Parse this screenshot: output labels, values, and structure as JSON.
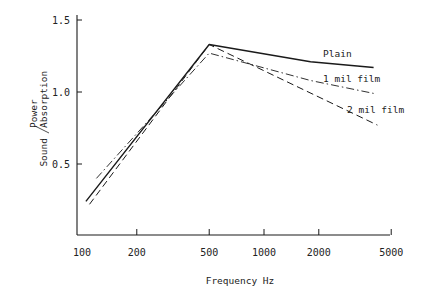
{
  "chart_data": {
    "type": "line",
    "title": "",
    "xlabel": "Frequency Hz",
    "ylabel_main": "Sound",
    "ylabel_sup": "Power",
    "ylabel_sub": "Absorption",
    "ylabel": "Sound Power / Absorption",
    "x_scale": "log",
    "x_ticks": [
      100,
      200,
      500,
      1000,
      2000,
      5000
    ],
    "x_tick_labels": [
      "100",
      "200",
      "500",
      "1000",
      "2000",
      "5000"
    ],
    "y_ticks": [
      0.5,
      1.0,
      1.5
    ],
    "y_tick_labels": [
      "0.5",
      "1.0",
      "1.5"
    ],
    "ylim": [
      0,
      1.55
    ],
    "grid": false,
    "legend_position": "inline labels at right end of lines",
    "series": [
      {
        "name": "Plain",
        "style": "solid",
        "x": [
          105,
          500,
          1800,
          4000
        ],
        "values": [
          0.24,
          1.33,
          1.21,
          1.17
        ]
      },
      {
        "name": "1 mil film",
        "style": "dash-dot",
        "x": [
          120,
          500,
          1800,
          4000
        ],
        "values": [
          0.4,
          1.27,
          1.08,
          0.99
        ]
      },
      {
        "name": "2 mil film",
        "style": "dashed",
        "x": [
          110,
          500,
          4200
        ],
        "values": [
          0.22,
          1.33,
          0.77
        ]
      }
    ]
  },
  "colors": {
    "line": "#1a1a1a",
    "background": "#ffffff"
  }
}
